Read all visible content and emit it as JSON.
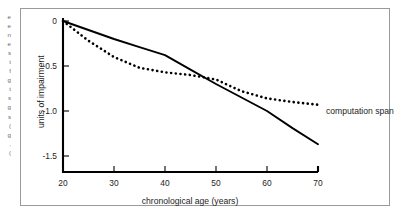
{
  "figure": {
    "margin_text_lines": [
      "e",
      "e",
      "n",
      "e",
      "s",
      "t",
      "f",
      "g",
      "t",
      "s",
      "g",
      "s",
      ")",
      "g",
      ",",
      ")"
    ]
  },
  "chart_data": {
    "type": "line",
    "title": "",
    "xlabel": "chronological age (years)",
    "ylabel": "units of impairment",
    "xlim": [
      20,
      70
    ],
    "ylim": [
      -1.75,
      0.08
    ],
    "xticks": [
      20,
      30,
      40,
      50,
      60,
      70
    ],
    "xtick_labels": [
      "20",
      "30",
      "40",
      "50",
      "60",
      "70"
    ],
    "yticks": [
      0,
      -0.5,
      -1.0,
      -1.5
    ],
    "ytick_labels": [
      "0",
      "-0.5",
      "-1.0",
      "-1.5"
    ],
    "grid": false,
    "legend_position": "inline-right",
    "series": [
      {
        "name": "solid-series",
        "label": "",
        "style": "solid",
        "color": "#000000",
        "x": [
          20,
          25,
          30,
          35,
          40,
          45,
          50,
          55,
          60,
          65,
          70
        ],
        "values": [
          0.0,
          -0.1,
          -0.2,
          -0.29,
          -0.38,
          -0.54,
          -0.7,
          -0.85,
          -1.0,
          -1.19,
          -1.37
        ]
      },
      {
        "name": "computation-span-series",
        "label": "computation span",
        "style": "dotted",
        "color": "#000000",
        "x": [
          20,
          25,
          30,
          35,
          40,
          45,
          50,
          55,
          60,
          65,
          70
        ],
        "values": [
          0.0,
          -0.22,
          -0.4,
          -0.52,
          -0.57,
          -0.6,
          -0.65,
          -0.78,
          -0.86,
          -0.9,
          -0.93
        ]
      }
    ],
    "annotations": [
      {
        "name": "computation-span-callout",
        "text": "computation span",
        "x": 70,
        "y": -0.93
      }
    ]
  }
}
